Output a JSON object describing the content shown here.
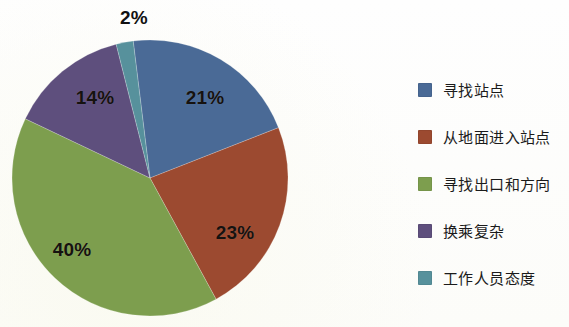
{
  "chart_data": {
    "type": "pie",
    "title": "",
    "subtitle": "",
    "xlabel": "",
    "ylabel": "",
    "legend_position": "right",
    "grid": false,
    "start_angle_deg": -7,
    "direction": "clockwise",
    "categories": [
      "寻找站点",
      "从地面进入站点",
      "寻找出口和方向",
      "换乘复杂",
      "工作人员态度"
    ],
    "values": [
      21,
      23,
      40,
      14,
      2
    ],
    "value_labels": [
      "21%",
      "23%",
      "40%",
      "14%",
      "2%"
    ],
    "colors": [
      "#4a6a96",
      "#9c4a30",
      "#7d9e4e",
      "#5e4f7d",
      "#57919c"
    ],
    "slices": [
      {
        "label": "寻找站点",
        "value": 21,
        "value_label": "21%",
        "color": "#4a6a96",
        "label_x": 205,
        "label_y": 98,
        "label_outside": false
      },
      {
        "label": "从地面进入站点",
        "value": 23,
        "value_label": "23%",
        "color": "#9c4a30",
        "label_x": 235,
        "label_y": 233,
        "label_outside": false
      },
      {
        "label": "寻找出口和方向",
        "value": 40,
        "value_label": "40%",
        "color": "#7d9e4e",
        "label_x": 72,
        "label_y": 250,
        "label_outside": false
      },
      {
        "label": "换乘复杂",
        "value": 14,
        "value_label": "14%",
        "color": "#5e4f7d",
        "label_x": 95,
        "label_y": 98,
        "label_outside": false
      },
      {
        "label": "工作人员态度",
        "value": 2,
        "value_label": "2%",
        "color": "#57919c",
        "label_x": 134,
        "label_y": 18,
        "label_outside": true
      }
    ]
  },
  "legend": {
    "items": [
      {
        "label": "寻找站点",
        "color": "#4a6a96"
      },
      {
        "label": "从地面进入站点",
        "color": "#9c4a30"
      },
      {
        "label": "寻找出口和方向",
        "color": "#7d9e4e"
      },
      {
        "label": "换乘复杂",
        "color": "#5e4f7d"
      },
      {
        "label": "工作人员态度",
        "color": "#57919c"
      }
    ]
  }
}
